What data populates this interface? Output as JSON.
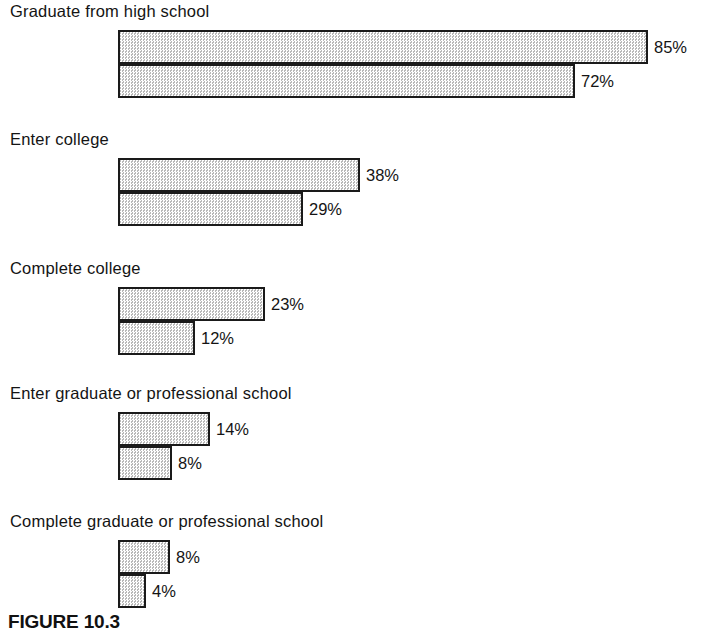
{
  "figure": {
    "caption": "FIGURE 10.3",
    "series_labels": [
      "Whites",
      "Blacks"
    ],
    "bar_fill_color": "#e3e3e3",
    "bar_border_color": "#1a1a1a",
    "text_color": "#141414",
    "background_color": "#ffffff"
  },
  "chart_data": {
    "type": "bar",
    "orientation": "horizontal",
    "title": "FIGURE 10.3",
    "xlabel": "",
    "ylabel": "",
    "xlim": [
      0,
      100
    ],
    "unit": "%",
    "grid": false,
    "legend": "none",
    "categories": [
      "Graduate from high school",
      "Enter college",
      "Complete college",
      "Enter graduate or professional school",
      "Complete graduate or professional school"
    ],
    "series": [
      {
        "name": "Whites",
        "values": [
          85,
          38,
          23,
          14,
          8
        ]
      },
      {
        "name": "Blacks",
        "values": [
          72,
          29,
          12,
          8,
          4
        ]
      }
    ],
    "value_labels": {
      "Whites": [
        "85%",
        "38%",
        "23%",
        "14%",
        "8%"
      ],
      "Blacks": [
        "72%",
        "29%",
        "12%",
        "8%",
        "4%"
      ]
    }
  },
  "groups": [
    {
      "title": "Graduate from high school",
      "rows": [
        {
          "label": "Whites",
          "value": 85,
          "value_label": "85%",
          "bar_width_px": 530
        },
        {
          "label": "Blacks",
          "value": 72,
          "value_label": "72%",
          "bar_width_px": 457
        }
      ]
    },
    {
      "title": "Enter college",
      "rows": [
        {
          "label": "Whites",
          "value": 38,
          "value_label": "38%",
          "bar_width_px": 242
        },
        {
          "label": "Blacks",
          "value": 29,
          "value_label": "29%",
          "bar_width_px": 185
        }
      ]
    },
    {
      "title": "Complete college",
      "rows": [
        {
          "label": "Whites",
          "value": 23,
          "value_label": "23%",
          "bar_width_px": 147
        },
        {
          "label": "Blacks",
          "value": 12,
          "value_label": "12%",
          "bar_width_px": 77
        }
      ]
    },
    {
      "title": "Enter graduate or professional school",
      "rows": [
        {
          "label": "Whites",
          "value": 14,
          "value_label": "14%",
          "bar_width_px": 92
        },
        {
          "label": "Blacks",
          "value": 8,
          "value_label": "8%",
          "bar_width_px": 54
        }
      ]
    },
    {
      "title": "Complete graduate or professional school",
      "rows": [
        {
          "label": "Whites",
          "value": 8,
          "value_label": "8%",
          "bar_width_px": 52
        },
        {
          "label": "Blacks",
          "value": 4,
          "value_label": "4%",
          "bar_width_px": 28
        }
      ]
    }
  ],
  "layout": {
    "group_tops": [
      2,
      130,
      259,
      384,
      512
    ],
    "title_offset": 0,
    "first_row_offset": 28,
    "row_height": 34,
    "bar_left": 118,
    "value_gap": 6
  }
}
